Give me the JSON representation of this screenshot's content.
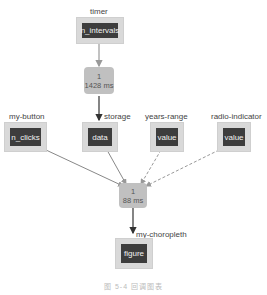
{
  "nodes": {
    "timer": {
      "label": "timer",
      "prop": "n_intervals"
    },
    "storage": {
      "label": "storage",
      "prop": "data"
    },
    "my_button": {
      "label": "my-button",
      "prop": "n_clicks"
    },
    "years_range": {
      "label": "years-range",
      "prop": "value"
    },
    "radio_indicator": {
      "label": "radio-indicator",
      "prop": "value"
    },
    "my_choropleth": {
      "label": "my-choropleth",
      "prop": "figure"
    }
  },
  "callbacks": {
    "cb1": {
      "count": "1",
      "time": "1428 ms"
    },
    "cb2": {
      "count": "1",
      "time": "88 ms"
    }
  },
  "caption": "图 5-4  回调图表"
}
